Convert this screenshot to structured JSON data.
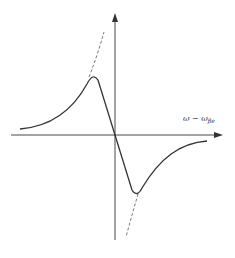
{
  "figure": {
    "x_axis_label": {
      "main": "ω − ω",
      "subscript": "βe"
    },
    "colors": {
      "stroke": "#333333",
      "background": "#ffffff"
    },
    "curves": {
      "solid": "dispersion-like response curve with maximum left of origin and minimum right of origin, passing through origin",
      "dashed": "asymptotic continuations above the maximum and below the minimum"
    }
  }
}
